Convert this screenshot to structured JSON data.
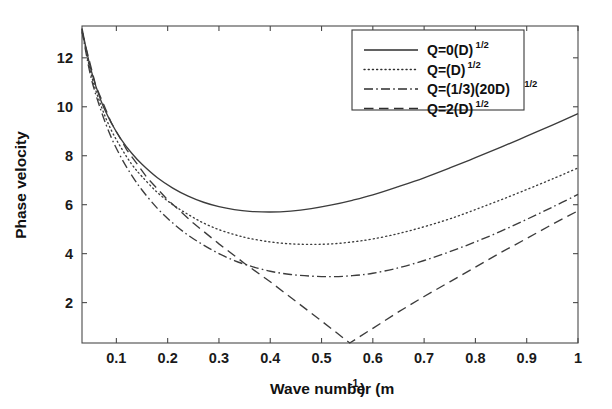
{
  "chart_data": {
    "type": "line",
    "title": "",
    "xlabel": "Wave number (m⁻¹)",
    "xlabel_base": "Wave number (m",
    "xlabel_sup": "-1",
    "xlabel_tail": ")",
    "ylabel": "Phase velocity",
    "xlim": [
      0.033,
      1.0
    ],
    "ylim": [
      0.35,
      13.3
    ],
    "grid": false,
    "legend_position": "upper right",
    "xticks": [
      0.1,
      0.2,
      0.3,
      0.4,
      0.5,
      0.6,
      0.7,
      0.8,
      0.9,
      1
    ],
    "xtick_labels": [
      "0.1",
      "0.2",
      "0.3",
      "0.4",
      "0.5",
      "0.6",
      "0.7",
      "0.8",
      "0.9",
      "1"
    ],
    "yticks": [
      2,
      4,
      6,
      8,
      10,
      12
    ],
    "ytick_labels": [
      "2",
      "4",
      "6",
      "8",
      "10",
      "12"
    ],
    "series": [
      {
        "name": "Q=0(D)^1/2",
        "legend_base": "Q=0(D)",
        "legend_sup": "1/2",
        "style": "solid",
        "x": [
          0.033,
          0.05,
          0.07,
          0.09,
          0.11,
          0.13,
          0.15,
          0.18,
          0.21,
          0.24,
          0.27,
          0.3,
          0.33,
          0.36,
          0.4,
          0.44,
          0.48,
          0.52,
          0.56,
          0.6,
          0.65,
          0.7,
          0.75,
          0.8,
          0.85,
          0.9,
          0.95,
          1.0
        ],
        "y": [
          13.2,
          11.55,
          10.25,
          9.35,
          8.65,
          8.1,
          7.65,
          7.1,
          6.68,
          6.35,
          6.1,
          5.92,
          5.8,
          5.73,
          5.7,
          5.74,
          5.84,
          5.99,
          6.18,
          6.4,
          6.74,
          7.1,
          7.5,
          7.92,
          8.35,
          8.8,
          9.25,
          9.72
        ]
      },
      {
        "name": "Q=(D)^1/2",
        "legend_base": "Q=(D)",
        "legend_sup": "1/2",
        "style": "dotted",
        "x": [
          0.033,
          0.05,
          0.07,
          0.09,
          0.11,
          0.13,
          0.15,
          0.18,
          0.21,
          0.24,
          0.27,
          0.3,
          0.33,
          0.36,
          0.4,
          0.44,
          0.48,
          0.52,
          0.56,
          0.6,
          0.65,
          0.7,
          0.75,
          0.8,
          0.85,
          0.9,
          0.95,
          1.0
        ],
        "y": [
          13.15,
          11.4,
          10.05,
          9.05,
          8.3,
          7.65,
          7.15,
          6.5,
          6.0,
          5.6,
          5.25,
          4.98,
          4.78,
          4.62,
          4.48,
          4.4,
          4.38,
          4.4,
          4.48,
          4.6,
          4.82,
          5.1,
          5.42,
          5.8,
          6.2,
          6.62,
          7.05,
          7.5
        ]
      },
      {
        "name": "Q=(1/3)(20D)^1/2",
        "legend_base": "Q=(1/3)(20D)",
        "legend_sup": "1/2",
        "style": "dashdot",
        "x": [
          0.033,
          0.05,
          0.07,
          0.09,
          0.11,
          0.13,
          0.15,
          0.18,
          0.21,
          0.24,
          0.27,
          0.3,
          0.33,
          0.36,
          0.4,
          0.44,
          0.48,
          0.52,
          0.56,
          0.6,
          0.65,
          0.7,
          0.75,
          0.8,
          0.85,
          0.9,
          0.95,
          1.0
        ],
        "y": [
          13.1,
          11.25,
          9.85,
          8.75,
          7.9,
          7.2,
          6.6,
          5.85,
          5.25,
          4.75,
          4.35,
          4.0,
          3.72,
          3.5,
          3.28,
          3.15,
          3.08,
          3.06,
          3.1,
          3.2,
          3.42,
          3.72,
          4.08,
          4.48,
          4.92,
          5.4,
          5.9,
          6.42
        ]
      },
      {
        "name": "Q=2(D)^1/2",
        "legend_base": "Q=2(D)",
        "legend_sup": "1/2",
        "style": "dashed",
        "x": [
          0.033,
          0.06,
          0.09,
          0.12,
          0.16,
          0.2,
          0.25,
          0.3,
          0.35,
          0.4,
          0.45,
          0.5,
          0.555,
          0.6,
          0.65,
          0.7,
          0.75,
          0.8,
          0.85,
          0.9,
          0.95,
          1.0
        ],
        "y": [
          13.05,
          10.85,
          9.35,
          8.25,
          7.1,
          6.2,
          5.25,
          4.4,
          3.6,
          2.85,
          2.05,
          1.25,
          0.35,
          0.95,
          1.62,
          2.25,
          2.85,
          3.45,
          4.05,
          4.62,
          5.2,
          5.75
        ]
      }
    ]
  },
  "figure": {
    "background_color": "#ffffff",
    "line_color": "#3c3c3c",
    "axis_color": "#4a4a4a"
  }
}
